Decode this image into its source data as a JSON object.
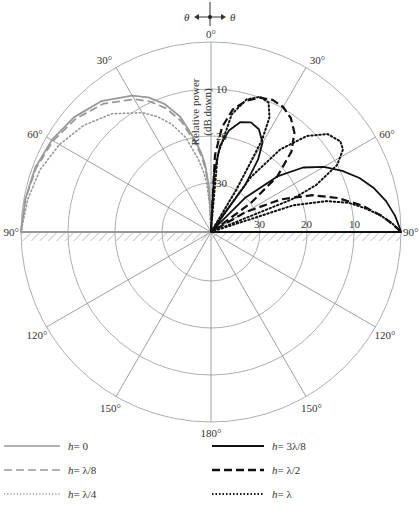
{
  "chart_data": {
    "type": "polar",
    "title": "",
    "direction_indicator": {
      "left": "θ",
      "right": "θ"
    },
    "radial_axis_label": [
      "Relative power",
      "(dB down)"
    ],
    "radial_ticks": [
      {
        "db": 0,
        "r": 190
      },
      {
        "db": 10,
        "r": 143
      },
      {
        "db": 20,
        "r": 96
      },
      {
        "db": 30,
        "r": 49
      }
    ],
    "radial_tick_labels_vertical": [
      "10",
      "20",
      "30"
    ],
    "radial_tick_labels_horizontal": [
      "30",
      "20",
      "10"
    ],
    "angle_labels": [
      {
        "angle": 0,
        "text": "0°"
      },
      {
        "angle": 30,
        "text": "30°"
      },
      {
        "angle": -30,
        "text": "30°"
      },
      {
        "angle": 60,
        "text": "60°"
      },
      {
        "angle": -60,
        "text": "60°"
      },
      {
        "angle": 90,
        "text": "90°"
      },
      {
        "angle": -90,
        "text": "90°"
      },
      {
        "angle": 120,
        "text": "120°"
      },
      {
        "angle": -120,
        "text": "120°"
      },
      {
        "angle": 150,
        "text": "150°"
      },
      {
        "angle": -150,
        "text": "150°"
      },
      {
        "angle": 180,
        "text": "180°"
      }
    ],
    "ground_plane": "hatched line at 90°–90° (horizontal)",
    "series": [
      {
        "name": "h = 0",
        "side": "left",
        "style": "solid",
        "color": "#999999",
        "width": 1.8,
        "points_deg_db": [
          [
            -90,
            0
          ],
          [
            -80,
            0.3
          ],
          [
            -70,
            0.6
          ],
          [
            -60,
            1.3
          ],
          [
            -50,
            2.4
          ],
          [
            -40,
            4.1
          ],
          [
            -30,
            6.9
          ],
          [
            -25,
            8.8
          ],
          [
            -20,
            11.4
          ],
          [
            -15,
            15
          ],
          [
            -10,
            20.4
          ],
          [
            -7,
            23.5
          ],
          [
            -5,
            26
          ],
          [
            -3,
            30
          ],
          [
            -1,
            36
          ]
        ]
      },
      {
        "name": "h = λ/8",
        "side": "left",
        "style": "dashed",
        "color": "#999999",
        "width": 1.8,
        "points_deg_db": [
          [
            -90,
            0
          ],
          [
            -80,
            0.3
          ],
          [
            -70,
            0.8
          ],
          [
            -60,
            1.6
          ],
          [
            -50,
            2.9
          ],
          [
            -40,
            4.8
          ],
          [
            -30,
            7.8
          ],
          [
            -25,
            9.8
          ],
          [
            -20,
            12.4
          ],
          [
            -15,
            16
          ],
          [
            -10,
            21.2
          ],
          [
            -7,
            24.3
          ],
          [
            -5,
            27
          ],
          [
            -3,
            31
          ],
          [
            -1,
            37
          ]
        ]
      },
      {
        "name": "h = λ/4",
        "side": "left",
        "style": "dotted",
        "color": "#999999",
        "width": 1.6,
        "points_deg_db": [
          [
            -90,
            0
          ],
          [
            -80,
            0.8
          ],
          [
            -70,
            1.7
          ],
          [
            -60,
            3.2
          ],
          [
            -50,
            5.1
          ],
          [
            -40,
            7.6
          ],
          [
            -30,
            11.1
          ],
          [
            -25,
            13.3
          ],
          [
            -20,
            16.0
          ],
          [
            -15,
            19.6
          ],
          [
            -10,
            24.6
          ],
          [
            -7,
            27.6
          ],
          [
            -5,
            30
          ],
          [
            -3,
            34
          ],
          [
            -1,
            40
          ]
        ]
      },
      {
        "name": "h = 3λ/8",
        "side": "right",
        "style": "solid",
        "color": "#111111",
        "width": 1.8,
        "points_deg_db": [
          [
            0,
            40
          ],
          [
            3,
            28
          ],
          [
            6,
            22
          ],
          [
            10,
            18.5
          ],
          [
            15,
            16.2
          ],
          [
            20,
            15.6
          ],
          [
            25,
            16.3
          ],
          [
            30,
            18.5
          ],
          [
            33,
            22
          ],
          [
            36,
            28
          ],
          [
            40,
            40
          ],
          [
            45,
            30
          ],
          [
            50,
            22
          ],
          [
            55,
            16.5
          ],
          [
            60,
            12.7
          ],
          [
            65,
            9.6
          ],
          [
            70,
            6.8
          ],
          [
            75,
            4.5
          ],
          [
            80,
            2.6
          ],
          [
            85,
            1.1
          ],
          [
            89,
            0.2
          ],
          [
            90,
            0
          ]
        ]
      },
      {
        "name": "h = λ/2",
        "side": "right",
        "style": "dashed",
        "color": "#111111",
        "width": 2.2,
        "points_deg_db": [
          [
            0,
            40
          ],
          [
            3,
            24
          ],
          [
            6,
            18
          ],
          [
            10,
            14
          ],
          [
            15,
            11.5
          ],
          [
            20,
            10
          ],
          [
            25,
            9.4
          ],
          [
            30,
            9.7
          ],
          [
            35,
            10.8
          ],
          [
            40,
            12.8
          ],
          [
            45,
            16.2
          ],
          [
            50,
            22
          ],
          [
            54,
            30
          ],
          [
            57,
            40
          ],
          [
            60,
            32
          ],
          [
            65,
            24
          ],
          [
            70,
            17.5
          ],
          [
            75,
            12.5
          ],
          [
            80,
            7.8
          ],
          [
            85,
            3.6
          ],
          [
            89,
            0.7
          ],
          [
            90,
            0
          ]
        ]
      },
      {
        "name": "h = λ",
        "side": "right",
        "style": "dotted",
        "color": "#111111",
        "width": 2,
        "points_deg_db": [
          [
            0,
            40
          ],
          [
            5,
            24
          ],
          [
            10,
            15
          ],
          [
            15,
            11.2
          ],
          [
            20,
            9.8
          ],
          [
            24,
            10.3
          ],
          [
            27,
            13
          ],
          [
            29,
            18
          ],
          [
            31,
            30
          ],
          [
            33,
            40
          ],
          [
            36,
            26
          ],
          [
            40,
            17.5
          ],
          [
            45,
            11.5
          ],
          [
            50,
            8
          ],
          [
            55,
            6.8
          ],
          [
            58,
            7.3
          ],
          [
            62,
            10
          ],
          [
            66,
            16
          ],
          [
            68,
            22
          ],
          [
            70,
            40
          ],
          [
            72,
            22
          ],
          [
            75,
            15
          ],
          [
            78,
            10.5
          ],
          [
            81,
            7.5
          ],
          [
            84,
            4.5
          ],
          [
            87,
            2
          ],
          [
            90,
            0
          ]
        ]
      }
    ]
  },
  "legend": [
    {
      "label_var": "h",
      "label_rest": " = 0",
      "style": "solid",
      "color": "#999999"
    },
    {
      "label_var": "h",
      "label_rest": " = λ/8",
      "style": "dashed",
      "color": "#999999"
    },
    {
      "label_var": "h",
      "label_rest": " = λ/4",
      "style": "dotted",
      "color": "#999999"
    },
    {
      "label_var": "h",
      "label_rest": " = 3λ/8",
      "style": "solid",
      "color": "#111111"
    },
    {
      "label_var": "h",
      "label_rest": " = λ/2",
      "style": "dashed",
      "color": "#111111"
    },
    {
      "label_var": "h",
      "label_rest": " = λ",
      "style": "dotted",
      "color": "#111111"
    }
  ]
}
